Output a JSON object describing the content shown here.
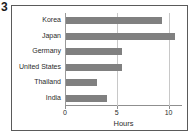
{
  "figure": {
    "index_label": "3"
  },
  "chart_data": {
    "type": "bar",
    "orientation": "horizontal",
    "title": "",
    "subtitle": "",
    "xlabel": "Hours",
    "ylabel": "",
    "categories": [
      "Korea",
      "Japan",
      "Germany",
      "United States",
      "Thailand",
      "India"
    ],
    "values": [
      9.3,
      10.5,
      5.4,
      5.4,
      3.0,
      4.0
    ],
    "series": [
      {
        "name": "Hours",
        "values": [
          9.3,
          10.5,
          5.4,
          5.4,
          3.0,
          4.0
        ]
      }
    ],
    "xlim": [
      0,
      11.3
    ],
    "xticks": [
      0,
      5,
      10
    ],
    "xticklabels": [
      "0",
      "5",
      "10"
    ],
    "grid": true,
    "grid_axis": "x",
    "legend": false,
    "legend_position": "none",
    "bar_color": "#808080",
    "gridline_color": "#c8c8c8",
    "axis_color": "#8f8f8f",
    "frame_color": "#5a5a5a",
    "text_color": "#2b2b2b",
    "background_color": "#ffffff"
  }
}
